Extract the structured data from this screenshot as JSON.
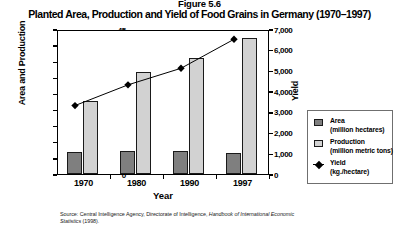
{
  "figure_caption": "Figure 5.6",
  "title": "Planted Area, Production and Yield of Food Grains in Germany (1970–1997)",
  "axes": {
    "left_label": "Area and Production",
    "right_label": "Yield",
    "x_label": "Year"
  },
  "legend": {
    "items": [
      {
        "name": "Area",
        "unit": "(million hectares)",
        "icon": "square-swatch-dark",
        "color": "#7f7f7f"
      },
      {
        "name": "Production",
        "unit": "(million metric tons)",
        "icon": "square-swatch-light",
        "color": "#d2d2d2"
      },
      {
        "name": "Yield",
        "unit": "(kg./hectare)",
        "icon": "diamond-line-marker",
        "color": "#000000"
      }
    ]
  },
  "source": {
    "prefix": "Source: Central Intelligence Agency, Directorate of Intelligence, ",
    "italic": "Handbook of International Economic Statistics",
    "suffix": " (1998)."
  },
  "chart_data": {
    "type": "bar",
    "title": "Planted Area, Production and Yield of Food Grains in Germany (1970–1997)",
    "xlabel": "Year",
    "ylabel": "Area and Production",
    "y2label": "Yield",
    "categories": [
      "1970",
      "1980",
      "1990",
      "1997"
    ],
    "ylim": [
      0,
      45
    ],
    "y2lim": [
      0,
      7000
    ],
    "yticks": [
      0,
      5,
      10,
      15,
      20,
      25,
      30,
      35,
      40,
      45
    ],
    "ytick_labels": [
      "0",
      "5",
      "10",
      "15",
      "20",
      "25",
      "30",
      "35",
      "40",
      "45"
    ],
    "y2ticks": [
      0,
      1000,
      2000,
      3000,
      4000,
      5000,
      6000,
      7000
    ],
    "y2tick_labels": [
      "0",
      "1,000",
      "2,000",
      "3,000",
      "4,000",
      "5,000",
      "6,000",
      "7,000"
    ],
    "grid": false,
    "legend_position": "right",
    "series": [
      {
        "name": "Area",
        "unit": "million hectares",
        "axis": "left",
        "type": "bar",
        "color": "#7f7f7f",
        "values": [
          6.8,
          7.2,
          7.2,
          6.6
        ]
      },
      {
        "name": "Production",
        "unit": "million metric tons",
        "axis": "left",
        "type": "bar",
        "color": "#d2d2d2",
        "values": [
          22.8,
          31.8,
          35.9,
          42.2
        ]
      },
      {
        "name": "Yield",
        "unit": "kg./hectare",
        "axis": "right",
        "type": "line",
        "color": "#000000",
        "values": [
          3400,
          4400,
          5200,
          6600
        ]
      }
    ]
  }
}
